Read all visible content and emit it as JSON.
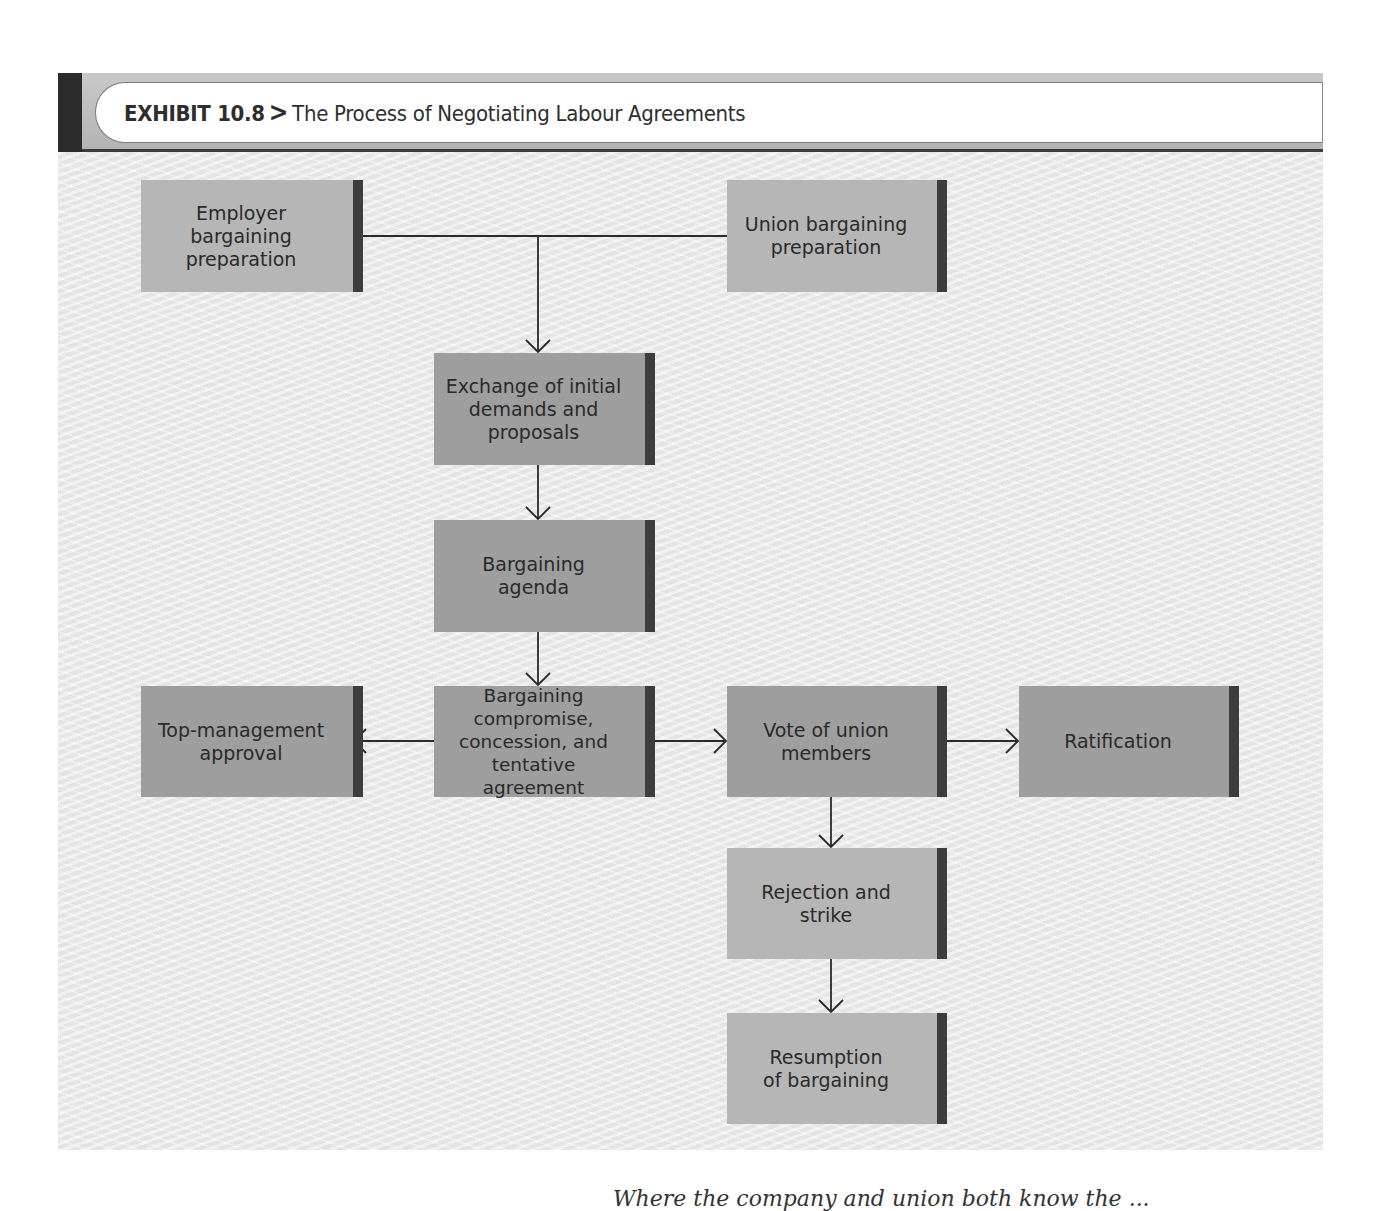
{
  "exhibit": {
    "label": "EXHIBIT 10.8",
    "separator": ">",
    "title": "The Process of Negotiating Labour Agreements"
  },
  "nodes": {
    "employer_prep": "Employer\nbargaining\npreparation",
    "union_prep": "Union bargaining\npreparation",
    "exchange": "Exchange of initial\ndemands and\nproposals",
    "agenda": "Bargaining\nagenda",
    "compromise": "Bargaining\ncompromise,\nconcession, and\ntentative agreement",
    "top_mgmt": "Top-management\napproval",
    "vote": "Vote of union\nmembers",
    "ratification": "Ratification",
    "rejection": "Rejection and\nstrike",
    "resumption": "Resumption\nof bargaining"
  },
  "edges": [
    {
      "from": "employer_prep",
      "to": "exchange"
    },
    {
      "from": "union_prep",
      "to": "exchange"
    },
    {
      "from": "exchange",
      "to": "agenda"
    },
    {
      "from": "agenda",
      "to": "compromise"
    },
    {
      "from": "compromise",
      "to": "top_mgmt"
    },
    {
      "from": "compromise",
      "to": "vote"
    },
    {
      "from": "vote",
      "to": "ratification"
    },
    {
      "from": "vote",
      "to": "rejection"
    },
    {
      "from": "rejection",
      "to": "resumption"
    }
  ],
  "colors": {
    "box_light": "#b6b6b6",
    "box_dark": "#9e9e9e",
    "box_edge": "#3d3d3d",
    "line": "#2a2a2a"
  },
  "footer_text": "Where the company and union both know the ... "
}
